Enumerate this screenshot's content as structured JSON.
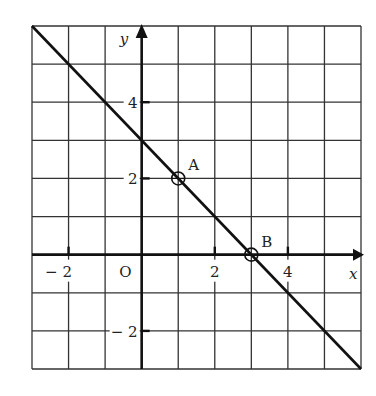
{
  "chart_data": {
    "type": "line",
    "title": "",
    "xlabel": "x",
    "ylabel": "y",
    "origin_label": "O",
    "xlim": [
      -3,
      6
    ],
    "ylim": [
      -3,
      6
    ],
    "grid": true,
    "x_ticks": [
      {
        "value": -2,
        "label": "− 2"
      },
      {
        "value": 2,
        "label": "2"
      },
      {
        "value": 4,
        "label": "4"
      }
    ],
    "y_ticks": [
      {
        "value": 4,
        "label": "4"
      },
      {
        "value": 2,
        "label": "2"
      },
      {
        "value": -2,
        "label": "− 2"
      }
    ],
    "series": [
      {
        "name": "line",
        "equation": "y = -x + 3",
        "x": [
          -3,
          6
        ],
        "y": [
          6,
          -3
        ]
      }
    ],
    "points": [
      {
        "name": "A",
        "x": 1,
        "y": 2
      },
      {
        "name": "B",
        "x": 3,
        "y": 0
      }
    ]
  }
}
